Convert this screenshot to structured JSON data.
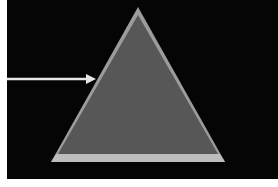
{
  "diagram": {
    "type": "pyramid-with-pointer",
    "background": "#050505",
    "shapes": [
      {
        "name": "triangle",
        "fill": "#5a5a5a",
        "border": "#9c9c9c",
        "base_band": "#bdbdbd"
      },
      {
        "name": "arrow",
        "color": "#e6e6e6",
        "points_to": "left edge of triangle"
      }
    ]
  }
}
